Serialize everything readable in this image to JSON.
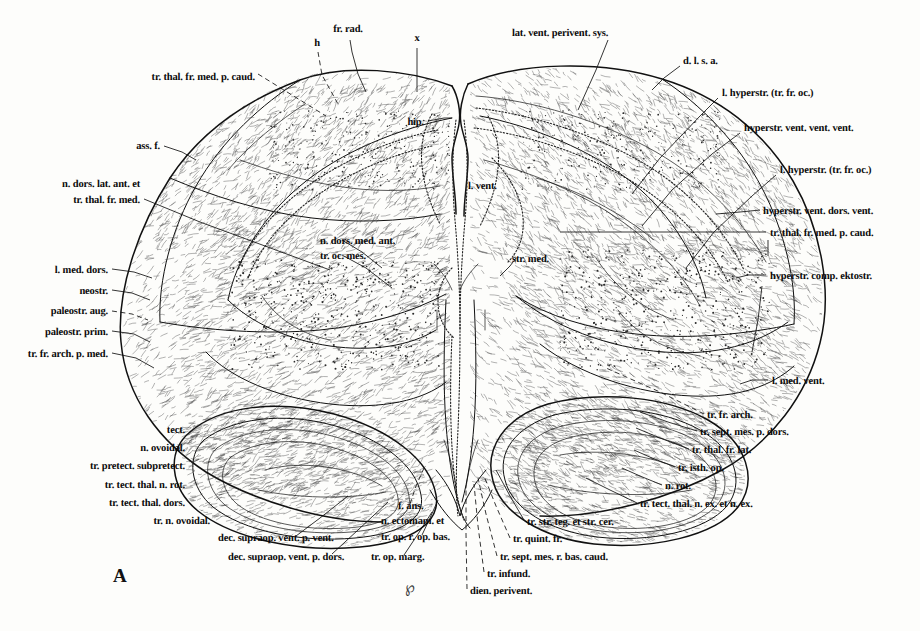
{
  "figure": {
    "panel_letter": "A",
    "artist_monogram": "℘",
    "caption_note": ""
  },
  "labels": {
    "left": [
      {
        "id": "tr-thal-fr-med-p-caud-left",
        "text": "tr. thal. fr. med. p. caud.",
        "x": 255,
        "y": 79,
        "align": "right",
        "leader": "dashed"
      },
      {
        "id": "ass-f",
        "text": "ass. f.",
        "x": 160,
        "y": 148,
        "align": "right",
        "leader": "solid"
      },
      {
        "id": "n-dors-lat-ant-et",
        "text": "n. dors. lat. ant. et",
        "x": 140,
        "y": 186,
        "align": "right",
        "leader": "none"
      },
      {
        "id": "tr-thal-fr-med",
        "text": "tr. thal. fr. med.",
        "x": 140,
        "y": 202,
        "align": "right",
        "leader": "solid"
      },
      {
        "id": "l-med-dors",
        "text": "l. med. dors.",
        "x": 108,
        "y": 272,
        "align": "right",
        "leader": "solid"
      },
      {
        "id": "neostr",
        "text": "neostr.",
        "x": 108,
        "y": 293,
        "align": "right",
        "leader": "solid"
      },
      {
        "id": "paleostr-aug",
        "text": "paleostr. aug.",
        "x": 108,
        "y": 313,
        "align": "right",
        "leader": "dashed"
      },
      {
        "id": "paleostr-prim",
        "text": "paleostr. prim.",
        "x": 108,
        "y": 334,
        "align": "right",
        "leader": "solid"
      },
      {
        "id": "tr-fr-arch-p-med",
        "text": "tr. fr. arch. p. med.",
        "x": 108,
        "y": 356,
        "align": "right",
        "leader": "solid"
      },
      {
        "id": "tect",
        "text": "tect.",
        "x": 185,
        "y": 432,
        "align": "right",
        "leader": "solid"
      },
      {
        "id": "n-ovoidal",
        "text": "n. ovoidal.",
        "x": 185,
        "y": 450,
        "align": "right",
        "leader": "solid"
      },
      {
        "id": "tr-pretect-subpretect",
        "text": "tr. pretect. subpretect.",
        "x": 185,
        "y": 468,
        "align": "right",
        "leader": "solid"
      },
      {
        "id": "tr-tect-thal-n-rot",
        "text": "tr. tect. thal. n. rot.",
        "x": 185,
        "y": 487,
        "align": "right",
        "leader": "solid"
      },
      {
        "id": "tr-tect-thal-dors",
        "text": "tr. tect. thal. dors.",
        "x": 185,
        "y": 505,
        "align": "right",
        "leader": "solid"
      },
      {
        "id": "tr-n-ovoidal",
        "text": "tr. n. ovoidal.",
        "x": 210,
        "y": 523,
        "align": "right",
        "leader": "solid"
      }
    ],
    "top": [
      {
        "id": "h",
        "text": "h",
        "x": 317,
        "y": 45,
        "align": "center",
        "leader": "dashed"
      },
      {
        "id": "fr-rad",
        "text": "fr. rad.",
        "x": 348,
        "y": 31,
        "align": "center",
        "leader": "solid"
      },
      {
        "id": "x",
        "text": "x",
        "x": 417,
        "y": 40,
        "align": "center",
        "leader": "solid"
      },
      {
        "id": "lat-vent-perivent-sys",
        "text": "lat. vent. perivent. sys.",
        "x": 512,
        "y": 35,
        "align": "left",
        "leader": "solid"
      }
    ],
    "center": [
      {
        "id": "hip",
        "text": "hip.",
        "x": 424,
        "y": 124,
        "align": "right",
        "leader": "solid"
      },
      {
        "id": "l-vent",
        "text": "l. vent.",
        "x": 468,
        "y": 188,
        "align": "left",
        "leader": "none"
      },
      {
        "id": "n-dors-med-ant",
        "text": "n. dors. med. ant.",
        "x": 320,
        "y": 243,
        "align": "left",
        "leader": "solid"
      },
      {
        "id": "tr-oc-mes",
        "text": "tr. oc. mes.",
        "x": 320,
        "y": 258,
        "align": "left",
        "leader": "solid"
      },
      {
        "id": "str-med",
        "text": "str. med.",
        "x": 512,
        "y": 261,
        "align": "left",
        "leader": "solid"
      }
    ],
    "right": [
      {
        "id": "d-l-s-a",
        "text": "d. l. s. a.",
        "x": 683,
        "y": 63,
        "align": "left",
        "leader": "solid"
      },
      {
        "id": "l-hyperstr-tr-fr-oc-1",
        "text": "l. hyperstr.  (tr. fr. oc.)",
        "x": 722,
        "y": 95,
        "align": "left",
        "leader": "solid"
      },
      {
        "id": "hyperstr-vent-vent-vent",
        "text": "hyperstr. vent. vent. vent.",
        "x": 744,
        "y": 130,
        "align": "left",
        "leader": "solid"
      },
      {
        "id": "l-hyperstr-tr-fr-oc-2",
        "text": "l. hyperstr.  (tr. fr. oc.)",
        "x": 780,
        "y": 172,
        "align": "left",
        "leader": "solid"
      },
      {
        "id": "hyperstr-vent-dors-vent",
        "text": "hyperstr. vent. dors. vent.",
        "x": 763,
        "y": 213,
        "align": "left",
        "leader": "solid"
      },
      {
        "id": "tr-thal-fr-med-p-caud-right",
        "text": "tr. thal. fr. med. p. caud.",
        "x": 770,
        "y": 235,
        "align": "left",
        "leader": "solid"
      },
      {
        "id": "hyperstr-comp-ektostr",
        "text": "hyperstr. comp. ektostr.",
        "x": 770,
        "y": 278,
        "align": "left",
        "leader": "solid"
      },
      {
        "id": "l-med-vent",
        "text": "l. med. vent.",
        "x": 772,
        "y": 383,
        "align": "left",
        "leader": "solid"
      },
      {
        "id": "tr-fr-arch",
        "text": "tr. fr. arch.",
        "x": 707,
        "y": 417,
        "align": "left",
        "leader": "dashed"
      },
      {
        "id": "tr-sept-mes-p-dors",
        "text": "tr. sept. mes. p. dors.",
        "x": 700,
        "y": 434,
        "align": "left",
        "leader": "solid"
      },
      {
        "id": "tr-thal-fr-lat",
        "text": "tr. thal. fr. lat.",
        "x": 692,
        "y": 452,
        "align": "left",
        "leader": "solid"
      },
      {
        "id": "tr-isth-op",
        "text": "tr. isth. op.",
        "x": 678,
        "y": 470,
        "align": "left",
        "leader": "solid"
      },
      {
        "id": "n-rot",
        "text": "n. rot.",
        "x": 665,
        "y": 488,
        "align": "left",
        "leader": "solid"
      },
      {
        "id": "tr-tect-thal-n-ex-et-n-ex",
        "text": "tr. tect. thal. n. ex. et n. ex.",
        "x": 640,
        "y": 506,
        "align": "left",
        "leader": "solid"
      }
    ],
    "bottom": [
      {
        "id": "dec-supraop-vent-p-vent",
        "text": "dec. supraop. vent. p. vent.",
        "x": 218,
        "y": 540,
        "align": "left",
        "leader": "solid"
      },
      {
        "id": "dec-supraop-vent-p-dors",
        "text": "dec. supraop. vent. p. dors.",
        "x": 228,
        "y": 559,
        "align": "left",
        "leader": "solid"
      },
      {
        "id": "f-ans",
        "text": "f. ans.",
        "x": 398,
        "y": 508,
        "align": "left",
        "leader": "dashed"
      },
      {
        "id": "n-ectomam-et",
        "text": "n. ectomam. et",
        "x": 381,
        "y": 523,
        "align": "left",
        "leader": "none"
      },
      {
        "id": "tr-op-r-op-bas",
        "text": "tr. op. r. op. bas.",
        "x": 381,
        "y": 539,
        "align": "left",
        "leader": "solid"
      },
      {
        "id": "tr-op-marg",
        "text": "tr. op. marg.",
        "x": 371,
        "y": 559,
        "align": "left",
        "leader": "solid"
      },
      {
        "id": "tr-str-teg-et-str-cer",
        "text": "tr. str. teg. et str. cer.",
        "x": 527,
        "y": 524,
        "align": "left",
        "leader": "solid"
      },
      {
        "id": "tr-quint-fr",
        "text": "tr. quint. fr.",
        "x": 513,
        "y": 541,
        "align": "left",
        "leader": "dashed"
      },
      {
        "id": "tr-sept-mes-r-bas-caud",
        "text": "tr. sept. mes. r. bas. caud.",
        "x": 500,
        "y": 559,
        "align": "left",
        "leader": "dashed"
      },
      {
        "id": "tr-infund",
        "text": "tr. infund.",
        "x": 487,
        "y": 576,
        "align": "left",
        "leader": "dashed"
      },
      {
        "id": "dien-perivent",
        "text": "dien. perivent.",
        "x": 470,
        "y": 593,
        "align": "left",
        "leader": "dashed"
      }
    ]
  }
}
